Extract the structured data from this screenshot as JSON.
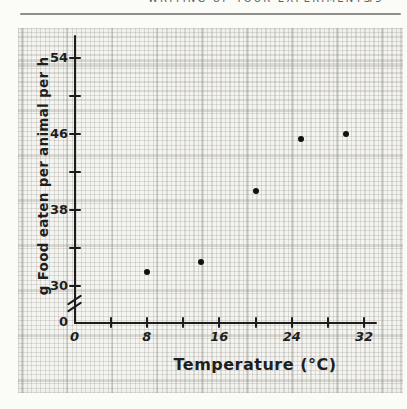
{
  "page": {
    "running_header": "WRITING UP YOUR EXPERIMENTS",
    "page_number": "75"
  },
  "chart_data": {
    "type": "scatter",
    "title": "",
    "xlabel": "Temperature (°C)",
    "ylabel": "g Food eaten per animal per h",
    "x": [
      8,
      14,
      20,
      25,
      30
    ],
    "y": [
      31.5,
      32.5,
      40,
      45.5,
      46
    ],
    "x_ticks_labeled": [
      0,
      8,
      16,
      24,
      32
    ],
    "x_ticks_minor": [
      4,
      12,
      20,
      28
    ],
    "y_ticks_labeled": [
      30,
      38,
      46,
      54
    ],
    "y_ticks_minor": [
      34,
      42,
      50
    ],
    "origin_label": "0",
    "y_axis_break": true,
    "xlim": [
      0,
      33
    ],
    "ylim": [
      30,
      56
    ],
    "grid": "graph-paper",
    "legend": "none",
    "colors": {
      "ink": "#1c1c1c",
      "point": "#111111",
      "paper": "#f4f4f0",
      "grid_minor": "#dddcd6",
      "grid_major": "#a3a29b"
    }
  }
}
